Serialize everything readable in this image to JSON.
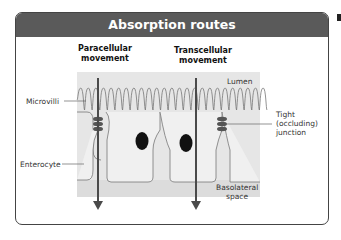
{
  "title": "Absorption routes",
  "headings": {
    "paracellular": [
      "Paracellular",
      "movement"
    ],
    "transcellular": [
      "Transcellular",
      "movement"
    ]
  },
  "labels": {
    "lumen": "Lumen",
    "microvilli": "Microvilli",
    "enterocyte": "Enterocyte",
    "tight_junction": [
      "Tight",
      "(occluding)",
      "junction"
    ],
    "basolateral": [
      "Basolateral",
      "space"
    ]
  },
  "colors": {
    "header_bg": "#5a5a5a",
    "diagram_bg": "#e6e6e6",
    "cell_fill": "#f0f0f0",
    "arrow": "#4a4a4a",
    "nucleus": "#111111"
  }
}
